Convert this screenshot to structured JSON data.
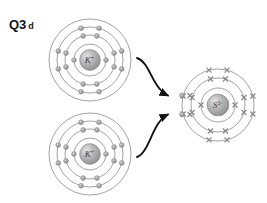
{
  "figure": {
    "label_main": "Q3",
    "label_part": "d",
    "background_color": "#ffffff",
    "shell_stroke_color": "#7a7a7a",
    "electron_dot_color": "#8d8d8d",
    "electron_cross_color": "#8a8a8a",
    "nucleus_color": "#8f8f8f",
    "arrow_color": "#111111",
    "text_color": "#141414"
  },
  "atoms": [
    {
      "id": "potassium-ion-top",
      "symbol": "K",
      "charge": "+",
      "nucleus_label": "K+",
      "center_x": 90,
      "center_y": 60,
      "shell_radii": [
        16,
        25,
        33,
        41
      ],
      "shell_electron_counts": [
        2,
        8,
        8,
        0
      ],
      "electron_style": "dot",
      "electron_marker": "circle"
    },
    {
      "id": "potassium-ion-bottom",
      "symbol": "K",
      "charge": "+",
      "nucleus_label": "K+",
      "center_x": 90,
      "center_y": 154,
      "shell_radii": [
        16,
        25,
        33,
        41
      ],
      "shell_electron_counts": [
        2,
        8,
        8,
        0
      ],
      "electron_style": "dot",
      "electron_marker": "circle"
    },
    {
      "id": "sulfide-ion",
      "symbol": "S",
      "charge": "2-",
      "nucleus_label": "S2-",
      "center_x": 218,
      "center_y": 105,
      "shell_radii": [
        17,
        27,
        36
      ],
      "shell_electron_counts": [
        2,
        8,
        8
      ],
      "electron_style": "cross",
      "electron_marker": "cross",
      "transferred_electron_marker": "circle",
      "transferred_electron_count": 2
    }
  ],
  "arrows": [
    {
      "id": "electron-transfer-arrow-top",
      "from_atom": "potassium-ion-top",
      "to_atom": "sulfide-ion",
      "label": ""
    },
    {
      "id": "electron-transfer-arrow-bottom",
      "from_atom": "potassium-ion-bottom",
      "to_atom": "sulfide-ion",
      "label": ""
    }
  ],
  "chart_data": {
    "type": "diagram",
    "species": [
      {
        "name": "K+",
        "electron_configuration": [
          2,
          8,
          8
        ],
        "electron_symbol": "dot",
        "count": 2
      },
      {
        "name": "S2-",
        "electron_configuration": [
          2,
          8,
          8
        ],
        "electron_symbol": "cross",
        "count": 1
      }
    ],
    "transfers": 2
  }
}
